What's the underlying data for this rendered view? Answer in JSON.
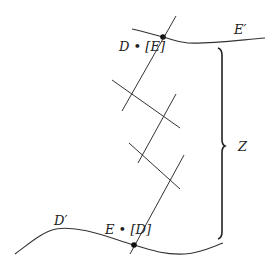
{
  "diagram": {
    "labels": {
      "top_curve": "E′",
      "bottom_curve": "D′",
      "top_point": "D • [E]",
      "bottom_point": "E • [D]",
      "brace": "Z"
    },
    "colors": {
      "line": "#333333",
      "text": "#222222",
      "background": "#ffffff"
    }
  }
}
